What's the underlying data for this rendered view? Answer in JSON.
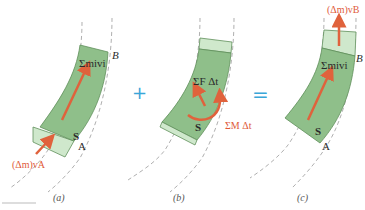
{
  "panels": [
    {
      "id": "a",
      "caption": "(a)",
      "labels": {
        "sum": "Σmᵢvᵢ",
        "boundary_top": "B",
        "boundary_bottom": "A",
        "system": "S",
        "inflow": "(Δm)vₐ"
      }
    },
    {
      "id": "b",
      "caption": "(b)",
      "labels": {
        "force_impulse": "ΣF Δt",
        "moment_impulse": "ΣM Δt",
        "system": "S"
      }
    },
    {
      "id": "c",
      "caption": "(c)",
      "labels": {
        "sum": "Σmᵢvᵢ",
        "boundary_top": "B",
        "boundary_bottom": "A",
        "system": "S",
        "outflow": "(Δm)vʙ"
      }
    }
  ],
  "operators": {
    "plus": "+",
    "equals": "="
  },
  "labels_text": {
    "a_inflow": "(Δm)vA",
    "c_outflow": "(Δm)vB",
    "sum": "Σmivi"
  },
  "colors": {
    "system_fill": "#8fbf8a",
    "system_stroke": "#5f8f5a",
    "slice_fill": "#cfe8cc",
    "arrow": "#e0623c",
    "operator": "#3aa6d8",
    "dashed": "#9a9a9a"
  }
}
